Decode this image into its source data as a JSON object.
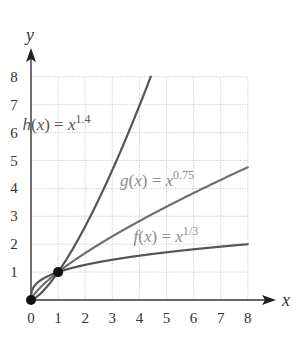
{
  "chart_data": {
    "type": "line",
    "title": "",
    "xlabel": "x",
    "ylabel": "y",
    "xlim": [
      0,
      8
    ],
    "ylim": [
      0,
      8
    ],
    "grid": true,
    "x_ticks": [
      "0",
      "1",
      "2",
      "3",
      "4",
      "5",
      "6",
      "7",
      "8"
    ],
    "y_ticks": [
      "1",
      "2",
      "3",
      "4",
      "5",
      "6",
      "7",
      "8"
    ],
    "series": [
      {
        "name": "h(x) = x^1.4",
        "exponent": 1.4,
        "color": "#555555",
        "label_parts": {
          "prefix_italic": "h",
          "lpar": "(",
          "var": "x",
          "rpar": ") = ",
          "base": "x",
          "exp": "1.4"
        },
        "x": [
          0,
          1,
          2,
          3,
          4,
          4.42
        ],
        "values": [
          0,
          1,
          2.64,
          4.66,
          6.96,
          8.0
        ]
      },
      {
        "name": "g(x) = x^0.75",
        "exponent": 0.75,
        "color": "#707070",
        "label_parts": {
          "prefix_italic": "g",
          "lpar": "(",
          "var": "x",
          "rpar": ") = ",
          "base": "x",
          "exp": "0.75"
        },
        "x": [
          0,
          1,
          2,
          3,
          4,
          5,
          6,
          7,
          8
        ],
        "values": [
          0,
          1,
          1.68,
          2.28,
          2.83,
          3.34,
          3.83,
          4.3,
          4.76
        ]
      },
      {
        "name": "f(x) = x^(1/3)",
        "exponent": 0.3333,
        "color": "#555555",
        "label_parts": {
          "prefix_italic": "f",
          "lpar": "(",
          "var": "x",
          "rpar": ") = ",
          "base": "x",
          "exp": "1/3"
        },
        "x": [
          0,
          1,
          2,
          3,
          4,
          5,
          6,
          7,
          8
        ],
        "values": [
          0,
          1,
          1.26,
          1.44,
          1.59,
          1.71,
          1.82,
          1.91,
          2.0
        ]
      }
    ],
    "marked_points": [
      {
        "x": 0,
        "y": 0
      },
      {
        "x": 1,
        "y": 1
      }
    ],
    "annotations": [
      {
        "text": "h(x) = x^1.4",
        "x": 1.9,
        "y": 6.3
      },
      {
        "text": "g(x) = x^0.75",
        "x": 5.5,
        "y": 4.3
      },
      {
        "text": "f(x) = x^1/3",
        "x": 6.0,
        "y": 2.3
      }
    ]
  }
}
